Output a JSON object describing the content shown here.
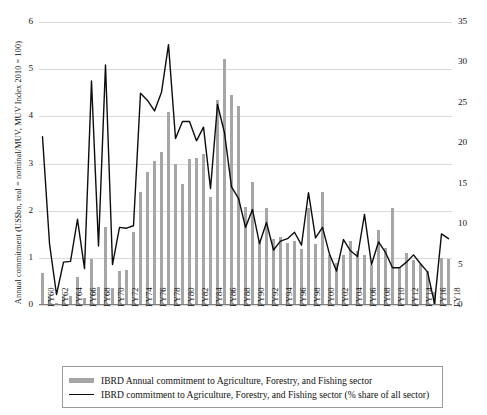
{
  "chart_data": {
    "type": "bar",
    "title": "",
    "xlabel": "",
    "ylabel": "Annual commitment (US$bn, real = nominal/MUV, MUV Index 2010 = 100)",
    "y2label": "AFF sector as % share of all sector",
    "ylim": [
      0,
      6
    ],
    "y2lim": [
      0,
      35
    ],
    "yticks": [
      "0",
      "1",
      "2",
      "3",
      "4",
      "5",
      "6"
    ],
    "y2ticks": [
      "0",
      "5",
      "10",
      "15",
      "20",
      "25",
      "30",
      "35"
    ],
    "grid": true,
    "legend_position": "bottom",
    "categories": [
      "FY60",
      "FY61",
      "FY62",
      "FY63",
      "FY64",
      "FY65",
      "FY66",
      "FY67",
      "FY68",
      "FY69",
      "FY70",
      "FY71",
      "FY72",
      "FY73",
      "FY74",
      "FY75",
      "FY76",
      "FY77",
      "FY78",
      "FY79",
      "FY80",
      "FY81",
      "FY82",
      "FY83",
      "FY84",
      "FY85",
      "FY86",
      "FY87",
      "FY88",
      "FY89",
      "FY90",
      "FY91",
      "FY92",
      "FY93",
      "FY94",
      "FY95",
      "FY96",
      "FY97",
      "FY98",
      "FY99",
      "FY00",
      "FY01",
      "FY02",
      "FY03",
      "FY04",
      "FY05",
      "FY06",
      "FY07",
      "FY08",
      "FY09",
      "FY10",
      "FY11",
      "FY12",
      "FY13",
      "FY14",
      "FY15",
      "FY16",
      "FY17",
      "FY18"
    ],
    "tick_labels_shown": [
      "FY60",
      "FY62",
      "FY64",
      "FY66",
      "FY68",
      "FY70",
      "FY72",
      "FY74",
      "FY76",
      "FY78",
      "FY80",
      "FY82",
      "FY84",
      "FY86",
      "FY88",
      "FY90",
      "FY92",
      "FY94",
      "FY96",
      "FY98",
      "FY00",
      "FY02",
      "FY04",
      "FY06",
      "FY08",
      "FY10",
      "FY12",
      "FY14",
      "FY16",
      "FY18"
    ],
    "series": [
      {
        "name": "IBRD Annual commitment to Agriculture, Forestry, and Fishing sector",
        "type": "bar",
        "axis": "left",
        "unit": "US$bn",
        "color": "#a6a6a6",
        "values": [
          0.68,
          0.2,
          0.04,
          0.2,
          0.19,
          0.6,
          0.14,
          0.97,
          0.38,
          1.65,
          0.36,
          0.72,
          0.75,
          1.55,
          2.4,
          2.82,
          3.05,
          3.25,
          4.1,
          3.0,
          2.57,
          3.1,
          3.12,
          3.2,
          2.3,
          4.35,
          5.22,
          4.45,
          4.23,
          2.08,
          2.6,
          1.35,
          2.05,
          1.4,
          1.45,
          1.32,
          1.35,
          1.18,
          2.05,
          1.3,
          2.4,
          1.05,
          0.9,
          1.05,
          1.35,
          1.15,
          1.05,
          0.85,
          1.6,
          1.2,
          2.05,
          0.8,
          1.1,
          0.95,
          0.88,
          0.72,
          0.28,
          1.0,
          0.98
        ]
      },
      {
        "name": "IBRD commitment to Agriculture, Forestry, and Fishing sector (% share of all sector)",
        "type": "line",
        "axis": "right",
        "unit": "%",
        "color": "#0d0d0d",
        "values": [
          20.8,
          7.6,
          1.3,
          5.3,
          5.4,
          10.6,
          4.5,
          27.7,
          7.3,
          29.7,
          5.0,
          9.6,
          9.5,
          9.8,
          26.2,
          25.3,
          24.0,
          26.3,
          32.2,
          20.6,
          22.7,
          22.7,
          20.3,
          22.0,
          14.4,
          24.8,
          21.3,
          14.6,
          13.2,
          9.6,
          11.8,
          7.6,
          10.2,
          6.8,
          7.9,
          8.2,
          9.0,
          7.4,
          13.9,
          8.3,
          9.6,
          6.3,
          4.2,
          8.1,
          6.7,
          6.0,
          11.2,
          5.0,
          7.8,
          6.5,
          4.6,
          4.6,
          5.3,
          6.2,
          5.1,
          4.1,
          0.2,
          8.8,
          8.2
        ]
      }
    ]
  },
  "legend": {
    "items": [
      {
        "swatch": "bar-swatch",
        "label": "IBRD Annual commitment to Agriculture, Forestry, and Fishing sector"
      },
      {
        "swatch": "line-swatch",
        "label": "IBRD commitment to Agriculture, Forestry, and Fishing sector (% share of all sector)"
      }
    ]
  },
  "colors": {
    "bar": "#a6a6a6",
    "line": "#0d0d0d",
    "grid": "#d9d9d9",
    "axis": "#7f7f7f",
    "background": "#ffffff"
  }
}
